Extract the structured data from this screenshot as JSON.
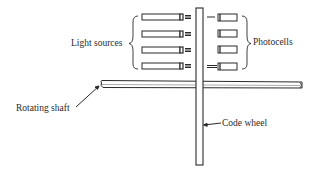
{
  "diagram": {
    "type": "optical shaft encoder schematic",
    "labels": {
      "light_sources": "Light sources",
      "photocells": "Photocells",
      "rotating_shaft": "Rotating shaft",
      "code_wheel": "Code wheel"
    },
    "light_source_count": 4,
    "photocell_count": 4,
    "colors": {
      "stroke": "#2a2a2a",
      "background": "#ffffff"
    }
  }
}
